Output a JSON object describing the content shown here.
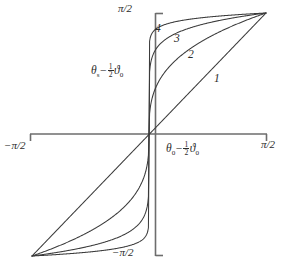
{
  "figure": {
    "background": "#ffffff",
    "axis_color": "#6d6d6d",
    "curve_color": "#3b3b3b",
    "text_color": "#2b2b2b"
  },
  "axes": {
    "x_title_parts": {
      "theta": "θ",
      "sub0": "0",
      "minus": "−",
      "half_num": "1",
      "half_den": "2",
      "vartheta": "ϑ",
      "vsub0": "0"
    },
    "y_title_parts": {
      "theta": "θ",
      "subs": "s",
      "minus": "−",
      "half_num": "1",
      "half_den": "2",
      "vartheta": "ϑ",
      "vsub0": "0"
    },
    "ticks": {
      "top": {
        "text": "π/2",
        "value": 1.5708
      },
      "bottom": {
        "text": "−π/2",
        "value": -1.5708
      },
      "left": {
        "text": "−π/2",
        "value": -1.5708
      },
      "right": {
        "text": "π/2",
        "value": 1.5708
      }
    }
  },
  "chart_data": {
    "type": "line",
    "title": "",
    "xlabel": "θ₀ − ½ϑ₀",
    "ylabel": "θₛ − ½ϑ₀",
    "xlim": [
      -1.5708,
      1.5708
    ],
    "ylim": [
      -1.5708,
      1.5708
    ],
    "xtick_labels": [
      "−π/2",
      "π/2"
    ],
    "ytick_labels": [
      "−π/2",
      "π/2"
    ],
    "grid": false,
    "legend": "inline-curve-numbers",
    "annotations": [
      {
        "text": "1",
        "x": 0.72,
        "y": 0.7
      },
      {
        "text": "2",
        "x": 0.3,
        "y": 0.9
      },
      {
        "text": "3",
        "x": 0.12,
        "y": 1.06
      },
      {
        "text": "4",
        "x": -0.01,
        "y": 1.2
      }
    ],
    "note": "Odd (point-symmetric) saturating curves through origin and (±π/2, ±π/2). Curve 1 is the identity; 2,3,4 are progressively steeper near the origin.",
    "series": [
      {
        "name": "1",
        "label": "1",
        "steepness": 1,
        "x": [
          -1.5708,
          -1.3744,
          -1.178,
          -0.9817,
          -0.7854,
          -0.589,
          -0.3927,
          -0.1963,
          0,
          0.1963,
          0.3927,
          0.589,
          0.7854,
          0.9817,
          1.178,
          1.3744,
          1.5708
        ],
        "y": [
          -1.5708,
          -1.3744,
          -1.178,
          -0.9817,
          -0.7854,
          -0.589,
          -0.3927,
          -0.1963,
          0,
          0.1963,
          0.3927,
          0.589,
          0.7854,
          0.9817,
          1.178,
          1.3744,
          1.5708
        ]
      },
      {
        "name": "2",
        "label": "2",
        "steepness": 3,
        "x": [
          -1.5708,
          -1.3744,
          -1.178,
          -0.9817,
          -0.7854,
          -0.589,
          -0.3927,
          -0.1963,
          0,
          0.1963,
          0.3927,
          0.589,
          0.7854,
          0.9817,
          1.178,
          1.3744,
          1.5708
        ],
        "y": [
          -1.5708,
          -1.5233,
          -1.4506,
          -1.3441,
          -1.1964,
          -1.0049,
          -0.7739,
          -0.4161,
          0,
          0.4161,
          0.7739,
          1.0049,
          1.1964,
          1.3441,
          1.4506,
          1.5233,
          1.5708
        ]
      },
      {
        "name": "3",
        "label": "3",
        "steepness": 8,
        "x": [
          -1.5708,
          -1.3744,
          -1.178,
          -0.9817,
          -0.7854,
          -0.589,
          -0.3927,
          -0.1963,
          0,
          0.1963,
          0.3927,
          0.589,
          0.7854,
          0.9817,
          1.178,
          1.3744,
          1.5708
        ],
        "y": [
          -1.5708,
          -1.5612,
          -1.5444,
          -1.5153,
          -1.4638,
          -1.3726,
          -1.2105,
          -0.8634,
          0,
          0.8634,
          1.2105,
          1.3726,
          1.4638,
          1.5153,
          1.5444,
          1.5612,
          1.5708
        ]
      },
      {
        "name": "4",
        "label": "4",
        "steepness": 20,
        "x": [
          -1.5708,
          -1.3744,
          -1.178,
          -0.9817,
          -0.7854,
          -0.589,
          -0.3927,
          -0.1963,
          0,
          0.1963,
          0.3927,
          0.589,
          0.7854,
          0.9817,
          1.178,
          1.3744,
          1.5708
        ],
        "y": [
          -1.5708,
          -1.5691,
          -1.5659,
          -1.5597,
          -1.5474,
          -1.5223,
          -1.4639,
          -1.2695,
          0,
          1.2695,
          1.4639,
          1.5223,
          1.5474,
          1.5597,
          1.5659,
          1.5691,
          1.5708
        ]
      }
    ]
  }
}
